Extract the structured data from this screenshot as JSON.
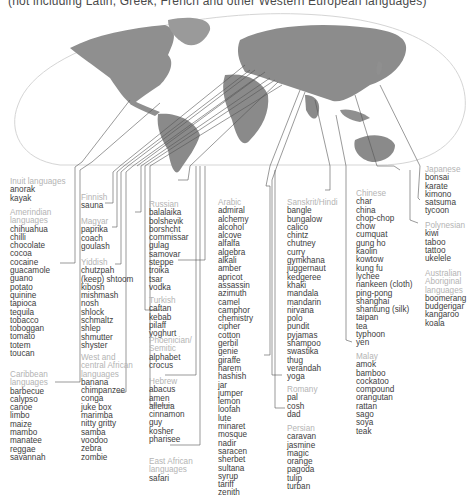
{
  "caption": "(not including Latin, Greek, French and other Western European languages)",
  "colors": {
    "header": "#b4b4b4",
    "word": "#3d3d3d",
    "land": "#8a8a8a",
    "ocean_outline": "#d0d0d0",
    "leader": "#555555"
  },
  "groups": [
    {
      "id": "inuit",
      "header": [
        "Inuit languages"
      ],
      "words": [
        "anorak",
        "kayak"
      ]
    },
    {
      "id": "amerindian",
      "header": [
        "Amerindian",
        "languages"
      ],
      "words": [
        "chihuahua",
        "chilli",
        "chocolate",
        "cocoa",
        "cocaine",
        "guacamole",
        "guano",
        "potato",
        "quinine",
        "tapioca",
        "tequila",
        "tobacco",
        "toboggan",
        "tomato",
        "totem",
        "toucan"
      ]
    },
    {
      "id": "caribbean",
      "header": [
        "Caribbean",
        "languages"
      ],
      "words": [
        "barbecue",
        "calypso",
        "canoe",
        "limbo",
        "maize",
        "mambo",
        "manatee",
        "reggae",
        "savannah"
      ]
    },
    {
      "id": "finnish",
      "header": [
        "Finnish"
      ],
      "words": [
        "sauna"
      ]
    },
    {
      "id": "magyar",
      "header": [
        "Magyar"
      ],
      "words": [
        "paprika",
        "coach",
        "goulash"
      ]
    },
    {
      "id": "yiddish",
      "header": [
        "Yiddish"
      ],
      "words": [
        "chutzpah",
        "(keep) shtoom",
        "kibosh",
        "mishmash",
        "nosh",
        "shlock",
        "schmaltz",
        "shlep",
        "shmutter",
        "shyster"
      ]
    },
    {
      "id": "west-central-african",
      "header": [
        "West and",
        "central African",
        "languages"
      ],
      "words": [
        "banana",
        "chimpanzee",
        "conga",
        "juke box",
        "marimba",
        "nitty gritty",
        "samba",
        "voodoo",
        "zebra",
        "zombie"
      ]
    },
    {
      "id": "russian",
      "header": [
        "Russian"
      ],
      "words": [
        "balalaika",
        "bolshevik",
        "borshcht",
        "commissar",
        "gulag",
        "samovar",
        "steppe",
        "troika",
        "tsar",
        "vodka"
      ]
    },
    {
      "id": "turkish",
      "header": [
        "Turkish"
      ],
      "words": [
        "caftan",
        "kebab",
        "pilaff",
        "yoghurt"
      ]
    },
    {
      "id": "phoenician-semitic",
      "header": [
        "Phoenician/",
        "Semitic"
      ],
      "words": [
        "alphabet",
        "crocus"
      ]
    },
    {
      "id": "hebrew",
      "header": [
        "Hebrew"
      ],
      "words": [
        "abacus",
        "amen",
        "alleluia",
        "cinnamon",
        "guy",
        "kosher",
        "pharisee"
      ]
    },
    {
      "id": "east-african",
      "header": [
        "East African",
        "languages"
      ],
      "words": [
        "safari"
      ]
    },
    {
      "id": "arabic",
      "header": [
        "Arabic"
      ],
      "words": [
        "admiral",
        "alchemy",
        "alcohol",
        "alcove",
        "alfalfa",
        "algebra",
        "alkali",
        "amber",
        "apricot",
        "assassin",
        "azimuth",
        "camel",
        "camphor",
        "chemistry",
        "cipher",
        "cotton",
        "gerbil",
        "genie",
        "giraffe",
        "harem",
        "hashish",
        "jar",
        "jumper",
        "lemon",
        "loofah",
        "lute",
        "minaret",
        "mosque",
        "nadir",
        "saracen",
        "sherbet",
        "sultana",
        "syrup",
        "tariff",
        "zenith"
      ]
    },
    {
      "id": "sanskrit-hindi",
      "header": [
        "Sanskrit/Hindi"
      ],
      "words": [
        "bangle",
        "bungalow",
        "calico",
        "chintz",
        "chutney",
        "curry",
        "gymkhana",
        "juggernaut",
        "kedgeree",
        "khaki",
        "mandala",
        "mandarin",
        "nirvana",
        "polo",
        "pundit",
        "pyjamas",
        "shampoo",
        "swastika",
        "thug",
        "verandah",
        "yoga"
      ]
    },
    {
      "id": "romany",
      "header": [
        "Romany"
      ],
      "words": [
        "pal",
        "cosh",
        "dad"
      ]
    },
    {
      "id": "persian",
      "header": [
        "Persian"
      ],
      "words": [
        "caravan",
        "jasmine",
        "magic",
        "orange",
        "pagoda",
        "tulip",
        "turban"
      ]
    },
    {
      "id": "chinese",
      "header": [
        "Chinese"
      ],
      "words": [
        "char",
        "china",
        "chop-chop",
        "chow",
        "cumquat",
        "gung ho",
        "kaolin",
        "kowtow",
        "kung fu",
        "lychee",
        "nankeen (cloth)",
        "ping-pong",
        "shanghai",
        "shantung (silk)",
        "taipan",
        "tea",
        "typhoon",
        "yen"
      ]
    },
    {
      "id": "malay",
      "header": [
        "Malay"
      ],
      "words": [
        "amok",
        "bamboo",
        "cockatoo",
        "compound",
        "orangutan",
        "rattan",
        "sago",
        "soya",
        "teak"
      ]
    },
    {
      "id": "japanese",
      "header": [
        "Japanese"
      ],
      "words": [
        "bonsai",
        "karate",
        "kimono",
        "satsuma",
        "tycoon"
      ]
    },
    {
      "id": "polynesian",
      "header": [
        "Polynesian"
      ],
      "words": [
        "kiwi",
        "taboo",
        "tattoo",
        "ukelele"
      ]
    },
    {
      "id": "australian-aboriginal",
      "header": [
        "Australian",
        "Aboriginal",
        "languages"
      ],
      "words": [
        "boomerang",
        "budgerigar",
        "kangaroo",
        "koala"
      ]
    }
  ]
}
